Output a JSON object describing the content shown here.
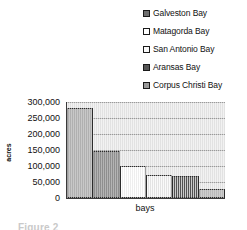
{
  "chart_data": {
    "type": "bar",
    "title": "",
    "xlabel": "bays",
    "ylabel": "acres",
    "categories": [
      "Galveston Bay",
      "Matagorda Bay",
      "San Antonio Bay",
      "Aransas Bay",
      "Corpus Christi Bay",
      "Other Bay"
    ],
    "values": [
      280000,
      147000,
      100000,
      72000,
      68000,
      28000
    ],
    "ylim": [
      0,
      300000
    ],
    "ytick_values": [
      0,
      50000,
      100000,
      150000,
      200000,
      250000,
      300000
    ],
    "ytick_labels": [
      "0",
      "50,000",
      "100,000",
      "150,000",
      "200,000",
      "250,000",
      "300,000"
    ],
    "grid": true,
    "legend_position": "top-right",
    "series": [
      {
        "name": "acres",
        "values": [
          280000,
          147000,
          100000,
          72000,
          68000,
          28000
        ]
      }
    ],
    "bar_colors": [
      "#8e8e8e",
      "#5e5e5e",
      "#fdfdfd",
      "#f1f1f1",
      "#575757",
      "#9c9c9c"
    ],
    "plot_background": "#e2e2e2",
    "gridline_color": "#9a9a9a",
    "axis_color": "#3a3a3a"
  },
  "legend": {
    "items": [
      {
        "label": "Galveston Bay",
        "swatch_color": "#6f6f6f"
      },
      {
        "label": "Matagorda Bay",
        "swatch_color": "#ffffff"
      },
      {
        "label": "San Antonio Bay",
        "swatch_color": "#fafafa"
      },
      {
        "label": "Aransas Bay",
        "swatch_color": "#555555"
      },
      {
        "label": "Corpus Christi Bay",
        "swatch_color": "#9a9a9a"
      }
    ]
  },
  "caption": {
    "text": "Figure 2"
  }
}
